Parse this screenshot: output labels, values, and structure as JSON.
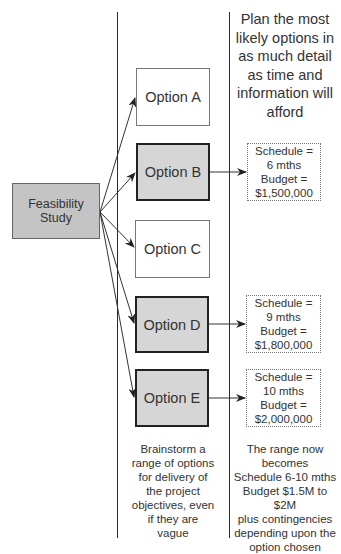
{
  "feasibility": {
    "label": "Feasibility Study"
  },
  "options": [
    {
      "label": "Option A",
      "selected": false
    },
    {
      "label": "Option B",
      "selected": true
    },
    {
      "label": "Option C",
      "selected": false
    },
    {
      "label": "Option D",
      "selected": true
    },
    {
      "label": "Option E",
      "selected": false
    }
  ],
  "details": {
    "b": {
      "lines": [
        "Schedule =",
        "6 mths",
        "Budget =",
        "$1,500,000"
      ]
    },
    "d": {
      "lines": [
        "Schedule =",
        "9 mths",
        "Budget =",
        "$1,800,000"
      ]
    },
    "e": {
      "lines": [
        "Schedule =",
        "10 mths",
        "Budget =",
        "$2,000,000"
      ]
    }
  },
  "heading": {
    "lines": [
      "Plan the most",
      "likely options in",
      "as much detail",
      "as time and",
      "information will",
      "afford"
    ]
  },
  "captions": {
    "left": {
      "lines": [
        "Brainstorm a",
        "range of options",
        "for delivery of",
        "the project",
        "objectives, even",
        "if they are",
        "vague"
      ]
    },
    "right": {
      "lines": [
        "The range now",
        "becomes",
        "Schedule 6-10 mths",
        "Budget $1.5M to $2M",
        "plus contingencies",
        "depending upon the",
        "option chosen"
      ]
    }
  },
  "colors": {
    "feasibility_fill": "#c4c4c4",
    "selected_fill": "#d6d6d6",
    "line": "#2a2a2a"
  }
}
